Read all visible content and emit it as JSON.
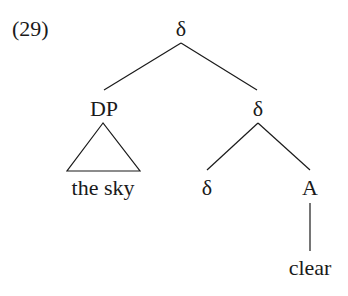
{
  "example_number": "(29)",
  "tree": {
    "root": {
      "label": "δ"
    },
    "left": {
      "label": "DP",
      "terminal": "the sky",
      "terminal_style": "triangle"
    },
    "right": {
      "label": "δ",
      "left": {
        "label": "δ"
      },
      "right": {
        "label": "A",
        "terminal": "clear"
      }
    }
  }
}
